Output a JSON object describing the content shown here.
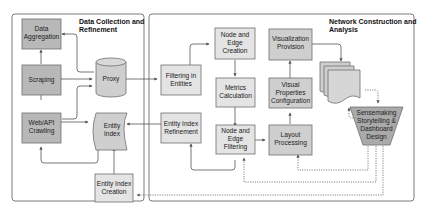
{
  "colors": {
    "dark_box": "#b8b8b8",
    "mid_box": "#cfcfcf",
    "light_box": "#e4e4e4",
    "border": "#6e6e6e",
    "panel_border": "#7a7a7a",
    "arrow": "#555555"
  },
  "panels": {
    "left": {
      "title_line1": "Data Collection and",
      "title_line2": "Refinement"
    },
    "right": {
      "title_line1": "Network Construction and",
      "title_line2": "Analysis"
    }
  },
  "nodes": {
    "data_aggregation": {
      "line1": "Data",
      "line2": "Aggregation"
    },
    "scraping": {
      "line1": "Scraping"
    },
    "web_api_crawling": {
      "line1": "Web/API",
      "line2": "Crawling"
    },
    "proxy": {
      "line1": "Proxy"
    },
    "entity_index": {
      "line1": "Entity",
      "line2": "Index"
    },
    "entity_index_creation": {
      "line1": "Entity Index",
      "line2": "Creation"
    },
    "filtering_in_entities": {
      "line1": "Filtering in",
      "line2": "Entities"
    },
    "entity_index_refinement": {
      "line1": "Entity Index",
      "line2": "Refinement"
    },
    "node_edge_creation": {
      "line1": "Node and",
      "line2": "Edge",
      "line3": "Creation"
    },
    "metrics_calculation": {
      "line1": "Metrics",
      "line2": "Calculation"
    },
    "node_edge_filtering": {
      "line1": "Node and",
      "line2": "Edge",
      "line3": "Filtering"
    },
    "visualization_provision": {
      "line1": "Visualization",
      "line2": "Provision"
    },
    "visual_properties_configuration": {
      "line1": "Visual",
      "line2": "Properties",
      "line3": "Configuration"
    },
    "layout_processing": {
      "line1": "Layout",
      "line2": "Processing"
    },
    "sensemaking": {
      "line1": "Sensemaking",
      "line2": "Storytelling &",
      "line3": "Dashboard",
      "line4": "Design"
    }
  }
}
